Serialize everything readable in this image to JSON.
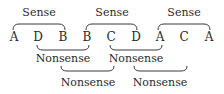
{
  "diagram": {
    "sequence": [
      "A",
      "D",
      "B",
      "B",
      "C",
      "D",
      "A",
      "C",
      "A"
    ],
    "top_groups": [
      {
        "label": "Sense",
        "span": [
          0,
          2
        ]
      },
      {
        "label": "Sense",
        "span": [
          3,
          5
        ]
      },
      {
        "label": "Sense",
        "span": [
          6,
          8
        ]
      }
    ],
    "bottom_groups_level1": [
      {
        "label": "Nonsense",
        "span": [
          1,
          3
        ]
      },
      {
        "label": "Nonsense",
        "span": [
          4,
          6
        ]
      }
    ],
    "bottom_groups_level2": [
      {
        "label": "Nonsense",
        "span": [
          2,
          4
        ]
      },
      {
        "label": "Nonsense",
        "span": [
          5,
          7
        ]
      }
    ]
  }
}
